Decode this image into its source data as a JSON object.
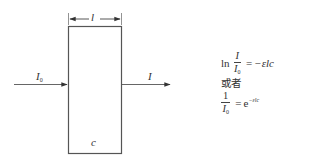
{
  "diagram": {
    "box": {
      "x": 68,
      "y": 26,
      "width": 53,
      "height": 127,
      "stroke": "#555555"
    },
    "dimension": {
      "label": "l",
      "y": 19
    },
    "incident_beam": {
      "label": "I",
      "label_subscript": "0"
    },
    "transmitted_beam": {
      "label": "I"
    },
    "concentration_label": "c"
  },
  "formulas": {
    "eq1": {
      "ln": "ln",
      "numerator": "I",
      "denominator": "I",
      "denominator_subscript": "0",
      "equals": "=",
      "rhs": "−εlc"
    },
    "connector": "或者",
    "eq2": {
      "numerator": "1",
      "denominator": "I",
      "denominator_subscript": "0",
      "equals": "=",
      "rhs_base": "e",
      "rhs_exponent": "−εlc"
    }
  },
  "colors": {
    "line": "#555555",
    "text": "#333333",
    "background": "#ffffff"
  }
}
